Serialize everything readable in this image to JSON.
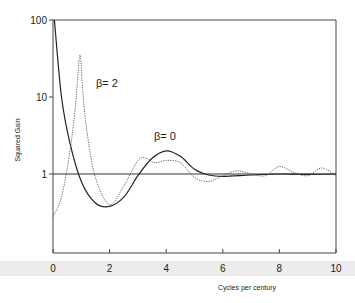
{
  "chart_data": {
    "type": "line",
    "title": "",
    "xlabel": "Cycles per century",
    "ylabel": "Squared Gain",
    "xlim": [
      0,
      10
    ],
    "ylim": [
      0.1,
      100
    ],
    "yscale": "log",
    "x_ticks": [
      "0",
      "2",
      "4",
      "6",
      "8",
      "10"
    ],
    "y_ticks": [
      "1",
      "10",
      "100"
    ],
    "grid": false,
    "reference_line": {
      "y": 1
    },
    "annotations": [
      {
        "text": "β= 2",
        "x": 2.3,
        "y": 8
      },
      {
        "text": "β= 0",
        "x": 3.5,
        "y": 2.6
      }
    ],
    "series": [
      {
        "name": "β= 0",
        "style": "solid",
        "x": [
          0.05,
          0.3,
          0.6,
          1.0,
          1.5,
          2.0,
          2.5,
          3.0,
          3.5,
          4.0,
          4.5,
          5.0,
          5.5,
          6.0,
          7.0,
          8.0,
          9.0,
          10.0
        ],
        "y": [
          100,
          10,
          2.5,
          0.8,
          0.42,
          0.38,
          0.5,
          0.95,
          1.6,
          2.0,
          1.7,
          1.15,
          0.97,
          0.93,
          0.97,
          1.0,
          0.99,
          1.0
        ]
      },
      {
        "name": "β= 2",
        "style": "dotted",
        "x": [
          0,
          0.3,
          0.6,
          0.8,
          0.95,
          1.05,
          1.2,
          1.5,
          2.0,
          2.5,
          3.0,
          3.3,
          3.6,
          4.0,
          4.5,
          5.0,
          5.5,
          6.0,
          6.5,
          7.0,
          7.5,
          8.0,
          8.5,
          9.0,
          9.5,
          10.0
        ],
        "y": [
          0.28,
          0.5,
          2.0,
          8,
          35,
          12,
          3.5,
          0.9,
          0.4,
          0.7,
          1.5,
          1.6,
          1.4,
          1.5,
          1.4,
          0.9,
          0.8,
          0.95,
          1.1,
          1.0,
          0.95,
          1.25,
          1.05,
          0.95,
          1.2,
          0.95
        ]
      }
    ]
  },
  "axes": {
    "xlabel": "Cycles per century",
    "ylabel": "Squared Gain",
    "x_ticks": [
      "0",
      "2",
      "4",
      "6",
      "8",
      "10"
    ],
    "y_ticks": [
      "1",
      "10",
      "100"
    ]
  },
  "annotations": {
    "beta2": "β= 2",
    "beta0": "β= 0"
  }
}
